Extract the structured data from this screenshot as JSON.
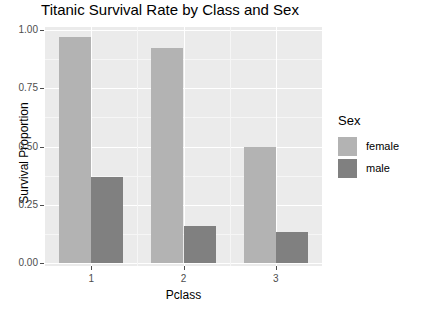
{
  "chart_data": {
    "type": "bar",
    "title": "Titanic Survival Rate by Class and Sex",
    "xlabel": "Pclass",
    "ylabel": "Survival Proportion",
    "categories": [
      "1",
      "2",
      "3"
    ],
    "series": [
      {
        "name": "female",
        "color": "#b3b3b3",
        "values": [
          0.968,
          0.921,
          0.5
        ]
      },
      {
        "name": "male",
        "color": "#808080",
        "values": [
          0.369,
          0.157,
          0.135
        ]
      }
    ],
    "ylim": [
      0,
      1
    ],
    "ytick_labels": [
      "0.00",
      "0.25",
      "0.50",
      "0.75",
      "1.00"
    ],
    "ytick_values": [
      0,
      0.25,
      0.5,
      0.75,
      1
    ],
    "grid": true,
    "legend_position": "right",
    "legend_title": "Sex",
    "panel_background": "#ebebeb",
    "grid_major_color": "#ffffff",
    "grid_minor_color": "#f6f6f6",
    "axis_text_color": "#4d4d4d"
  }
}
